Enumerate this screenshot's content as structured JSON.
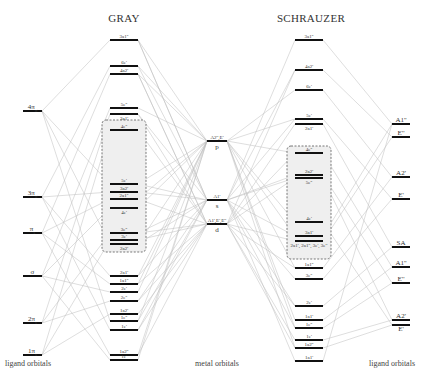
{
  "titles": {
    "left": "GRAY",
    "right": "SCHRAUZER"
  },
  "footer": {
    "left": "ligand orbitals",
    "center": "metal orbitals",
    "right": "ligand orbitals"
  },
  "ligand_left": [
    {
      "label": "4πσ",
      "base": "4π",
      "sub": "σ",
      "y": 111
    },
    {
      "label": "3πσ",
      "base": "3π",
      "sub": "σ",
      "y": 197
    },
    {
      "label": "πs",
      "base": "π",
      "sub": "s",
      "y": 233
    },
    {
      "label": "σ",
      "base": "σ",
      "sub": "",
      "y": 276
    },
    {
      "label": "2πs",
      "base": "2π",
      "sub": "s",
      "y": 323
    },
    {
      "label": "1πs",
      "base": "1π",
      "sub": "s",
      "y": 355
    }
  ],
  "metal": [
    {
      "label": "A2'',E'",
      "sym": "p",
      "y": 141
    },
    {
      "label": "A1'",
      "sym": "s",
      "y": 200
    },
    {
      "label": "A1',E',E''",
      "sym": "d",
      "y": 224
    }
  ],
  "gray": [
    {
      "label": "3a1''",
      "y": 40
    },
    {
      "label": "6e'",
      "y": 66
    },
    {
      "label": "4a2'",
      "y": 74
    },
    {
      "label": "5e''",
      "y": 108
    },
    {
      "label": "3a1'",
      "y": 114,
      "label_below": true
    },
    {
      "label": "4e''",
      "y": 130
    },
    {
      "label": "5e'",
      "y": 184
    },
    {
      "label": "3a2'",
      "y": 192
    },
    {
      "label": "2a1''",
      "y": 199
    },
    {
      "label": "4e'",
      "y": 208,
      "label_below": true
    },
    {
      "label": "3e''",
      "y": 233
    },
    {
      "label": "3e'",
      "y": 240
    },
    {
      "label": "2a2'",
      "y": 244,
      "label_below": true
    },
    {
      "label": "2a1'",
      "y": 276
    },
    {
      "label": "1a1''",
      "y": 284
    },
    {
      "label": "2e'",
      "y": 292
    },
    {
      "label": "2e''",
      "y": 301
    },
    {
      "label": "1a2'",
      "y": 314
    },
    {
      "label": "1e''",
      "y": 321
    },
    {
      "label": "1e'",
      "y": 330
    },
    {
      "label": "1a2''",
      "y": 355
    },
    {
      "label": "1e'",
      "y": 360
    }
  ],
  "gray_box": {
    "y1": 120,
    "y2": 252
  },
  "schrauzer": [
    {
      "label": "3a1''",
      "y": 40
    },
    {
      "label": "4a2'",
      "y": 70
    },
    {
      "label": "6e'",
      "y": 90
    },
    {
      "label": "5e'",
      "y": 119
    },
    {
      "label": "2a1'",
      "y": 124,
      "label_below": true
    },
    {
      "label": "4e''",
      "y": 153
    },
    {
      "label": "2a2'",
      "y": 175
    },
    {
      "label": "5e''",
      "y": 178,
      "label_below": true
    },
    {
      "label": "4e'",
      "y": 222
    },
    {
      "label": "3a1'",
      "y": 236
    },
    {
      "label": "2a1', 2a1'', 3e', 3e''",
      "y": 241,
      "label_below": true
    },
    {
      "label": "1a1''",
      "y": 268
    },
    {
      "label": "3e''",
      "y": 279
    },
    {
      "label": "2e'",
      "y": 306
    },
    {
      "label": "1a1'",
      "y": 320
    },
    {
      "label": "1e''",
      "y": 328
    },
    {
      "label": "1e'",
      "y": 340
    },
    {
      "label": "1a2''",
      "y": 348
    },
    {
      "label": "1a1'",
      "y": 361
    }
  ],
  "schrauzer_box": {
    "y1": 146,
    "y2": 259
  },
  "ligand_right": [
    {
      "label": "A1''",
      "y": 124
    },
    {
      "label": "E''",
      "y": 137
    },
    {
      "label": "A2'",
      "y": 177
    },
    {
      "label": "E'",
      "y": 199
    },
    {
      "label": "SA",
      "y": 247
    },
    {
      "label": "A1''",
      "y": 267
    },
    {
      "label": "E''",
      "y": 283
    },
    {
      "label": "A2'",
      "y": 320
    },
    {
      "label": "E'",
      "y": 325,
      "label_below": true
    }
  ]
}
